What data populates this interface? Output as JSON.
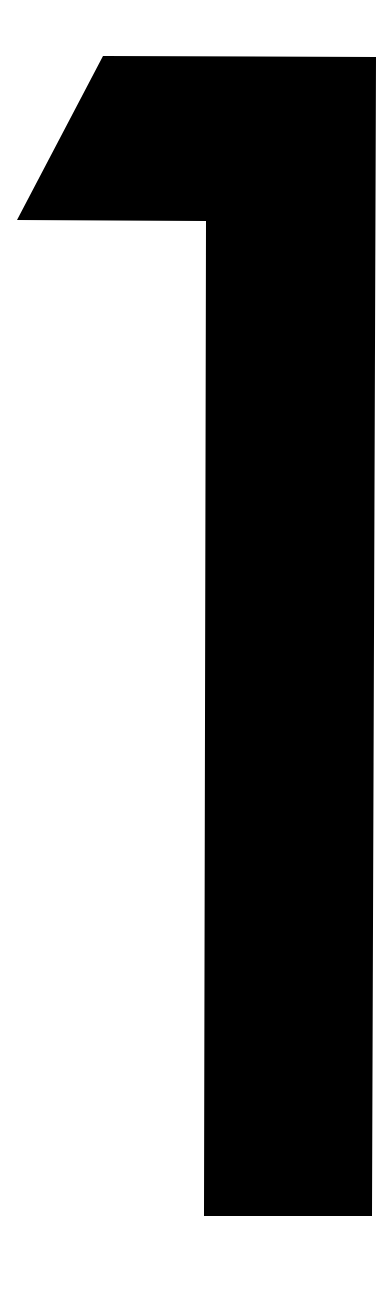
{
  "page": {
    "background_color": "#ffffff",
    "width": 384,
    "height": 1291
  },
  "glyph": {
    "character": "1",
    "name": "numeral-one",
    "fill_color": "#000000",
    "description": "1"
  },
  "chart_data": {
    "type": "shape",
    "title": "1",
    "shapes": [
      {
        "name": "numeral-one-outline",
        "fill": "#000000",
        "points": [
          [
            103,
            56
          ],
          [
            376,
            57
          ],
          [
            372,
            1216
          ],
          [
            204,
            1216
          ],
          [
            206,
            221
          ],
          [
            17,
            220
          ]
        ]
      }
    ],
    "xlim": [
      0,
      384
    ],
    "ylim": [
      0,
      1291
    ],
    "grid": false,
    "legend": false
  }
}
